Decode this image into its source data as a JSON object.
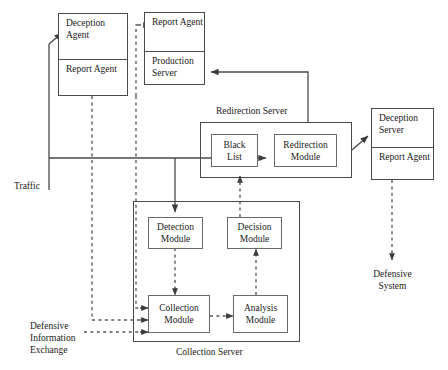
{
  "diagram": {
    "colors": {
      "stroke": "#4a4a4a",
      "stroke_light": "#6a6a6a",
      "text": "#1a1a1a",
      "background": "#ffffff"
    },
    "nodes": {
      "deception_agent_host": {
        "top_label": "Deception\nAgent",
        "bottom_label": "Report\nAgent"
      },
      "production_server_host": {
        "top_label": "Report\nAgent",
        "bottom_label": "Production\nServer"
      },
      "deception_server_host": {
        "top_label": "Deception\nServer",
        "bottom_label": "Report\nAgent"
      },
      "redirection_server": {
        "caption": "Redirection Server",
        "black_list": "Black\nList",
        "redirection_module": "Redirection\nModule"
      },
      "collection_server": {
        "caption": "Collection Server",
        "detection_module": "Detection\nModule",
        "decision_module": "Decision\nModule",
        "collection_module": "Collection\nModule",
        "analysis_module": "Analysis\nModule"
      }
    },
    "labels": {
      "traffic": "Traffic",
      "defensive_information_exchange": "Defensive\nInformation\nExchange",
      "defensive_system": "Defensive\nSystem"
    }
  }
}
